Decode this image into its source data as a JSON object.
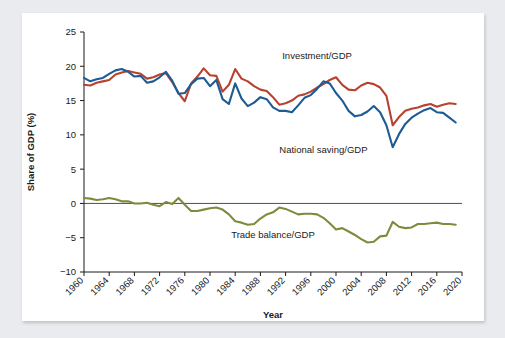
{
  "figure": {
    "background_color": "#e9ebee",
    "card_color": "#ffffff"
  },
  "chart_data": {
    "type": "line",
    "title": "",
    "xlabel": "Year",
    "ylabel": "Share of GDP (%)",
    "xlim": [
      1960,
      2020
    ],
    "ylim": [
      -10,
      25
    ],
    "grid": false,
    "legend_position": "inline-annotations",
    "xticks": [
      1960,
      1964,
      1968,
      1972,
      1976,
      1980,
      1984,
      1988,
      1992,
      1996,
      2000,
      2004,
      2008,
      2012,
      2016,
      2020
    ],
    "yticks": [
      25,
      20,
      15,
      10,
      5,
      0,
      -5,
      -10
    ],
    "ytick_labels": [
      "25",
      "20",
      "15",
      "10",
      "5",
      "0",
      "−5",
      "−10"
    ],
    "x": [
      1960,
      1961,
      1962,
      1963,
      1964,
      1965,
      1966,
      1967,
      1968,
      1969,
      1970,
      1971,
      1972,
      1973,
      1974,
      1975,
      1976,
      1977,
      1978,
      1979,
      1980,
      1981,
      1982,
      1983,
      1984,
      1985,
      1986,
      1987,
      1988,
      1989,
      1990,
      1991,
      1992,
      1993,
      1994,
      1995,
      1996,
      1997,
      1998,
      1999,
      2000,
      2001,
      2002,
      2003,
      2004,
      2005,
      2006,
      2007,
      2008,
      2009,
      2010,
      2011,
      2012,
      2013,
      2014,
      2015,
      2016,
      2017,
      2018,
      2019
    ],
    "series": [
      {
        "name": "Investment/GDP",
        "color": "#b8412f",
        "label_x": 1997,
        "label_y": 21.0,
        "values": [
          17.3,
          17.2,
          17.6,
          17.8,
          18.0,
          18.8,
          19.1,
          19.3,
          19.1,
          18.9,
          18.2,
          18.4,
          18.8,
          19.0,
          17.7,
          16.1,
          14.9,
          17.5,
          18.5,
          19.7,
          18.7,
          18.6,
          16.3,
          17.3,
          19.6,
          18.2,
          17.8,
          17.1,
          16.6,
          16.4,
          15.5,
          14.4,
          14.6,
          15.0,
          15.7,
          15.9,
          16.3,
          16.9,
          17.4,
          18.0,
          18.4,
          17.3,
          16.6,
          16.5,
          17.2,
          17.6,
          17.4,
          16.9,
          15.7,
          11.4,
          12.6,
          13.5,
          13.8,
          14.0,
          14.3,
          14.5,
          14.1,
          14.4,
          14.6,
          14.5
        ]
      },
      {
        "name": "National saving/GDP",
        "color": "#1d5b94",
        "label_x": 1998,
        "label_y": 7.3,
        "values": [
          18.3,
          17.8,
          18.1,
          18.3,
          18.9,
          19.4,
          19.6,
          19.2,
          18.5,
          18.6,
          17.6,
          17.8,
          18.4,
          19.2,
          17.9,
          16.0,
          16.1,
          17.4,
          18.2,
          18.3,
          17.1,
          18.0,
          15.2,
          14.5,
          17.5,
          15.3,
          14.2,
          14.7,
          15.5,
          15.2,
          14.0,
          13.5,
          13.5,
          13.3,
          14.3,
          15.4,
          15.8,
          16.7,
          17.8,
          17.5,
          16.1,
          15.0,
          13.5,
          12.7,
          12.9,
          13.4,
          14.2,
          13.3,
          11.4,
          8.2,
          10.1,
          11.6,
          12.5,
          13.1,
          13.6,
          13.9,
          13.3,
          13.2,
          12.5,
          11.8
        ]
      },
      {
        "name": "Trade balance/GDP",
        "color": "#7c8c3c",
        "label_x": 1990,
        "label_y": -5.1,
        "values": [
          0.8,
          0.7,
          0.5,
          0.6,
          0.8,
          0.6,
          0.3,
          0.3,
          0.0,
          0.0,
          0.1,
          -0.2,
          -0.4,
          0.2,
          -0.1,
          0.8,
          -0.2,
          -1.1,
          -1.1,
          -0.9,
          -0.7,
          -0.6,
          -0.9,
          -1.6,
          -2.6,
          -2.8,
          -3.1,
          -3.0,
          -2.2,
          -1.6,
          -1.3,
          -0.6,
          -0.8,
          -1.2,
          -1.6,
          -1.5,
          -1.5,
          -1.6,
          -2.1,
          -2.9,
          -3.8,
          -3.6,
          -4.1,
          -4.6,
          -5.2,
          -5.7,
          -5.6,
          -4.8,
          -4.7,
          -2.7,
          -3.4,
          -3.6,
          -3.5,
          -3.0,
          -3.0,
          -2.9,
          -2.8,
          -3.0,
          -3.0,
          -3.1
        ]
      }
    ]
  }
}
